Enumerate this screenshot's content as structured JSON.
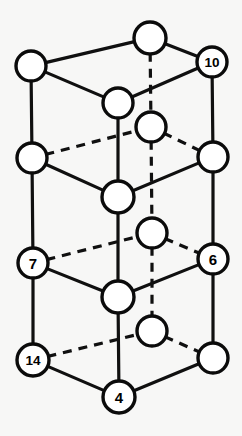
{
  "diagram": {
    "type": "3d-lattice",
    "background_color": "#f7f7f6",
    "line_color": "#101010",
    "node_fill": "#ffffff",
    "node_stroke": "#0b0b0b",
    "nodes": [
      {
        "id": "n1",
        "label": "",
        "x": 31,
        "y": 66,
        "r": 15,
        "name": "node-top-left"
      },
      {
        "id": "n2",
        "label": "",
        "x": 150,
        "y": 38,
        "r": 16,
        "name": "node-top-back"
      },
      {
        "id": "n3",
        "label": "10",
        "x": 212,
        "y": 62,
        "r": 15,
        "name": "node-10"
      },
      {
        "id": "n4",
        "label": "",
        "x": 118,
        "y": 103,
        "r": 15,
        "name": "node-top-front-center"
      },
      {
        "id": "n5",
        "label": "",
        "x": 151,
        "y": 127,
        "r": 15,
        "name": "node-upper-interior"
      },
      {
        "id": "n6",
        "label": "",
        "x": 32,
        "y": 158,
        "r": 15,
        "name": "node-mid-left-upper"
      },
      {
        "id": "n7",
        "label": "",
        "x": 213,
        "y": 157,
        "r": 15,
        "name": "node-mid-right-upper"
      },
      {
        "id": "n8",
        "label": "",
        "x": 118,
        "y": 197,
        "r": 16,
        "name": "node-mid-front-center"
      },
      {
        "id": "n9",
        "label": "",
        "x": 152,
        "y": 233,
        "r": 15,
        "name": "node-mid-interior"
      },
      {
        "id": "n10",
        "label": "7",
        "x": 33,
        "y": 263,
        "r": 15,
        "name": "node-7"
      },
      {
        "id": "n11",
        "label": "6",
        "x": 213,
        "y": 259,
        "r": 15,
        "name": "node-6"
      },
      {
        "id": "n12",
        "label": "",
        "x": 118,
        "y": 297,
        "r": 16,
        "name": "node-lower-front-center"
      },
      {
        "id": "n13",
        "label": "",
        "x": 152,
        "y": 331,
        "r": 15,
        "name": "node-lower-interior"
      },
      {
        "id": "n14",
        "label": "14",
        "x": 33,
        "y": 360,
        "r": 16,
        "name": "node-14"
      },
      {
        "id": "n15",
        "label": "",
        "x": 213,
        "y": 358,
        "r": 15,
        "name": "node-bottom-right"
      },
      {
        "id": "n16",
        "label": "4",
        "x": 119,
        "y": 397,
        "r": 16,
        "name": "node-4"
      }
    ],
    "edges": [
      {
        "from": "n1",
        "to": "n2",
        "style": "solid",
        "name": "edge-topleft-topback"
      },
      {
        "from": "n2",
        "to": "n3",
        "style": "solid",
        "name": "edge-topback-10"
      },
      {
        "from": "n1",
        "to": "n4",
        "style": "solid",
        "name": "edge-topleft-topfront"
      },
      {
        "from": "n4",
        "to": "n3",
        "style": "solid",
        "name": "edge-topfront-10"
      },
      {
        "from": "n2",
        "to": "n5",
        "style": "dashed",
        "name": "edge-topback-upperinterior"
      },
      {
        "from": "n1",
        "to": "n6",
        "style": "solid",
        "name": "edge-topleft-midleft"
      },
      {
        "from": "n3",
        "to": "n7",
        "style": "solid",
        "name": "edge-10-midright"
      },
      {
        "from": "n4",
        "to": "n8",
        "style": "solid",
        "name": "edge-topfront-midfront"
      },
      {
        "from": "n6",
        "to": "n5",
        "style": "dashed",
        "name": "edge-midleft-upperinterior"
      },
      {
        "from": "n5",
        "to": "n7",
        "style": "dashed",
        "name": "edge-upperinterior-midright"
      },
      {
        "from": "n6",
        "to": "n8",
        "style": "solid",
        "name": "edge-midleft-midfront"
      },
      {
        "from": "n8",
        "to": "n7",
        "style": "solid",
        "name": "edge-midfront-midright"
      },
      {
        "from": "n5",
        "to": "n9",
        "style": "dashed",
        "name": "edge-upperinterior-midinterior"
      },
      {
        "from": "n6",
        "to": "n10",
        "style": "solid",
        "name": "edge-midleft-7"
      },
      {
        "from": "n7",
        "to": "n11",
        "style": "solid",
        "name": "edge-midright-6"
      },
      {
        "from": "n8",
        "to": "n12",
        "style": "solid",
        "name": "edge-midfront-lowerfront"
      },
      {
        "from": "n10",
        "to": "n9",
        "style": "dashed",
        "name": "edge-7-midinterior"
      },
      {
        "from": "n9",
        "to": "n11",
        "style": "dashed",
        "name": "edge-midinterior-6"
      },
      {
        "from": "n10",
        "to": "n12",
        "style": "solid",
        "name": "edge-7-lowerfront"
      },
      {
        "from": "n12",
        "to": "n11",
        "style": "solid",
        "name": "edge-lowerfront-6"
      },
      {
        "from": "n9",
        "to": "n13",
        "style": "dashed",
        "name": "edge-midinterior-lowerinterior"
      },
      {
        "from": "n10",
        "to": "n14",
        "style": "solid",
        "name": "edge-7-14"
      },
      {
        "from": "n11",
        "to": "n15",
        "style": "solid",
        "name": "edge-6-bottomright"
      },
      {
        "from": "n12",
        "to": "n16",
        "style": "solid",
        "name": "edge-lowerfront-4"
      },
      {
        "from": "n14",
        "to": "n13",
        "style": "dashed",
        "name": "edge-14-lowerinterior"
      },
      {
        "from": "n13",
        "to": "n15",
        "style": "dashed",
        "name": "edge-lowerinterior-bottomright"
      },
      {
        "from": "n14",
        "to": "n16",
        "style": "solid",
        "name": "edge-14-4"
      },
      {
        "from": "n16",
        "to": "n15",
        "style": "solid",
        "name": "edge-4-bottomright"
      }
    ],
    "labels": [
      "10",
      "7",
      "6",
      "14",
      "4"
    ]
  }
}
